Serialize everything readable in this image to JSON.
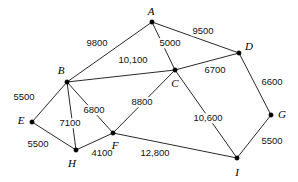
{
  "figure": {
    "type": "weighted-undirected-graph-diagram",
    "width": 298,
    "height": 182,
    "background_color": "#ffffff",
    "line_color": "#111111",
    "node_color": "#000000"
  },
  "chart_data": {
    "type": "diagram",
    "title": "",
    "xlabel": "",
    "ylabel": "",
    "grid": false,
    "legend": "none",
    "nodes": [
      {
        "id": "A",
        "label": "A",
        "x": 152,
        "y": 22,
        "label_x": 151,
        "label_y": 11
      },
      {
        "id": "B",
        "label": "B",
        "x": 67,
        "y": 82,
        "label_x": 61,
        "label_y": 70
      },
      {
        "id": "C",
        "label": "C",
        "x": 175,
        "y": 70,
        "label_x": 175,
        "label_y": 83
      },
      {
        "id": "D",
        "label": "D",
        "x": 239,
        "y": 53,
        "label_x": 249,
        "label_y": 46
      },
      {
        "id": "E",
        "label": "E",
        "x": 32,
        "y": 122,
        "label_x": 21,
        "label_y": 120
      },
      {
        "id": "F",
        "label": "F",
        "x": 113,
        "y": 133,
        "label_x": 115,
        "label_y": 145
      },
      {
        "id": "G",
        "label": "G",
        "x": 271,
        "y": 115,
        "label_x": 282,
        "label_y": 114
      },
      {
        "id": "H",
        "label": "H",
        "x": 76,
        "y": 150,
        "label_x": 72,
        "label_y": 163
      },
      {
        "id": "I",
        "label": "I",
        "x": 237,
        "y": 158,
        "label_x": 237,
        "label_y": 172
      }
    ],
    "edges": [
      {
        "from": "A",
        "to": "B",
        "weight": 9800,
        "label": "9800",
        "label_x": 97,
        "label_y": 43
      },
      {
        "from": "A",
        "to": "C",
        "weight": 5000,
        "label": "5000",
        "label_x": 170,
        "label_y": 43
      },
      {
        "from": "A",
        "to": "D",
        "weight": 9500,
        "label": "9500",
        "label_x": 203,
        "label_y": 31
      },
      {
        "from": "B",
        "to": "C",
        "weight": 10100,
        "label": "10,100",
        "label_x": 133,
        "label_y": 60
      },
      {
        "from": "B",
        "to": "E",
        "weight": 5500,
        "label": "5500",
        "label_x": 24,
        "label_y": 97
      },
      {
        "from": "B",
        "to": "F",
        "weight": 6800,
        "label": "6800",
        "label_x": 94,
        "label_y": 110
      },
      {
        "from": "B",
        "to": "H",
        "weight": 7100,
        "label": "7100",
        "label_x": 70,
        "label_y": 123
      },
      {
        "from": "C",
        "to": "D",
        "weight": 6700,
        "label": "6700",
        "label_x": 215,
        "label_y": 70
      },
      {
        "from": "C",
        "to": "F",
        "weight": 8800,
        "label": "8800",
        "label_x": 142,
        "label_y": 102
      },
      {
        "from": "C",
        "to": "I",
        "weight": 10600,
        "label": "10,600",
        "label_x": 208,
        "label_y": 118
      },
      {
        "from": "D",
        "to": "G",
        "weight": 6600,
        "label": "6600",
        "label_x": 272,
        "label_y": 82
      },
      {
        "from": "E",
        "to": "H",
        "weight": 5500,
        "label": "5500",
        "label_x": 38,
        "label_y": 144
      },
      {
        "from": "F",
        "to": "H",
        "weight": 4100,
        "label": "4100",
        "label_x": 102,
        "label_y": 153
      },
      {
        "from": "F",
        "to": "I",
        "weight": 12800,
        "label": "12,800",
        "label_x": 155,
        "label_y": 153
      },
      {
        "from": "G",
        "to": "I",
        "weight": 5500,
        "label": "5500",
        "label_x": 272,
        "label_y": 141
      }
    ]
  }
}
